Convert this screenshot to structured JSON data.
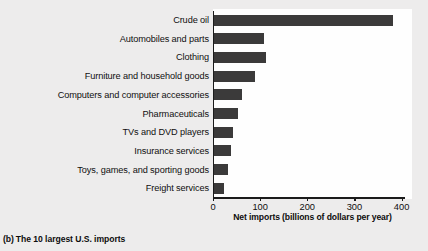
{
  "caption": {
    "index": "(b)",
    "text": "The 10 largest U.S. imports"
  },
  "colors": {
    "bar": "#3b3a3a",
    "axis": "#1b1b1b",
    "panel_background": "#fefefe",
    "figure_background": "#edecec",
    "text": "#100f0f"
  },
  "chart_data": {
    "type": "bar",
    "orientation": "horizontal",
    "title": "",
    "subtitle": "",
    "xlabel": "Net imports (billions of dollars per year)",
    "ylabel": "",
    "categories": [
      "Crude oil",
      "Automobiles and parts",
      "Clothing",
      "Furniture and household goods",
      "Computers and computer accessories",
      "Pharmaceuticals",
      "TVs and DVD players",
      "Insurance services",
      "Toys, games, and sporting goods",
      "Freight services"
    ],
    "values": [
      380,
      107,
      110,
      86,
      60,
      50,
      41,
      36,
      30,
      22
    ],
    "xlim": [
      0,
      420
    ],
    "xticks": [
      0,
      100,
      200,
      300,
      400
    ],
    "xtick_labels": [
      "0",
      "100",
      "200",
      "300",
      "400"
    ],
    "grid": false,
    "legend": null
  }
}
